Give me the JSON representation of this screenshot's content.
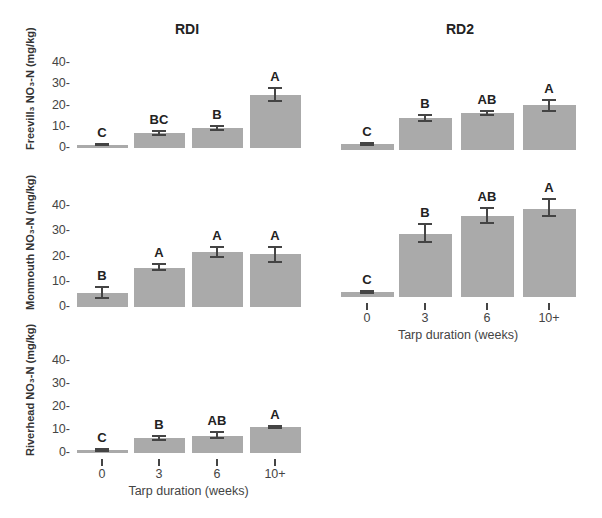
{
  "columns": [
    {
      "title": "RDI"
    },
    {
      "title": "RD2"
    }
  ],
  "rows": [
    {
      "ylabel": "Freevill₃ NO₃-N (mg/kg)"
    },
    {
      "ylabel": "Monmouth NO₃-N (mg/kg)"
    },
    {
      "ylabel": "Riverhead NO₃-N (mg/kg)"
    }
  ],
  "y_ticks": [
    "40-",
    "30-",
    "20-",
    "10-",
    "0-"
  ],
  "x_categories": [
    "0",
    "3",
    "6",
    "10+"
  ],
  "x_title": "Tarp duration (weeks)",
  "colors": {
    "bar": "#aaaaaa",
    "error": "#444444"
  },
  "chart_data": [
    {
      "type": "bar",
      "title": "RDI",
      "panel": "Freeville",
      "ylabel": "Freevill₃ NO₃-N (mg/kg)",
      "xlabel": "",
      "categories": [
        "0",
        "3",
        "6",
        "10+"
      ],
      "values": [
        1.5,
        7,
        9.5,
        25
      ],
      "error_low": [
        1.2,
        6,
        8.5,
        22
      ],
      "error_high": [
        2,
        7.8,
        10.3,
        28.5
      ],
      "letters": [
        "C",
        "BC",
        "B",
        "A"
      ],
      "ylim": [
        0,
        40
      ],
      "yticks": [
        0,
        10,
        20,
        30,
        40
      ]
    },
    {
      "type": "bar",
      "title": "RD2",
      "panel": "Freeville",
      "ylabel": "",
      "xlabel": "",
      "categories": [
        "0",
        "3",
        "6",
        "10+"
      ],
      "values": [
        3,
        15,
        17.5,
        21
      ],
      "error_low": [
        2.5,
        13.5,
        16.5,
        18.5
      ],
      "error_high": [
        3.5,
        16.5,
        18.5,
        23.5
      ],
      "letters": [
        "C",
        "B",
        "AB",
        "A"
      ],
      "ylim": [
        0,
        40
      ]
    },
    {
      "type": "bar",
      "title": "RDI",
      "panel": "Monmouth",
      "ylabel": "Monmouth NO₃-N (mg/kg)",
      "xlabel": "",
      "categories": [
        "0",
        "3",
        "6",
        "10+"
      ],
      "values": [
        5.5,
        15.5,
        22,
        21
      ],
      "error_low": [
        3.5,
        14.5,
        20,
        18
      ],
      "error_high": [
        8,
        17,
        24,
        24
      ],
      "letters": [
        "B",
        "A",
        "A",
        "A"
      ],
      "ylim": [
        0,
        40
      ],
      "yticks": [
        0,
        10,
        20,
        30,
        40
      ]
    },
    {
      "type": "bar",
      "title": "RD2",
      "panel": "Monmouth",
      "ylabel": "",
      "xlabel": "Tarp duration (weeks)",
      "categories": [
        "0",
        "3",
        "6",
        "10+"
      ],
      "values": [
        2,
        25,
        32,
        35
      ],
      "error_low": [
        1.5,
        22,
        29.5,
        32
      ],
      "error_high": [
        2.5,
        29,
        35.5,
        39
      ],
      "letters": [
        "C",
        "B",
        "AB",
        "A"
      ],
      "ylim": [
        0,
        40
      ]
    },
    {
      "type": "bar",
      "title": "",
      "panel": "Riverhead",
      "ylabel": "Riverhead NO₃-N (mg/kg)",
      "xlabel": "Tarp duration (weeks)",
      "categories": [
        "0",
        "3",
        "6",
        "10+"
      ],
      "values": [
        1.3,
        6.5,
        7.5,
        11.3
      ],
      "error_low": [
        1,
        5.8,
        6.5,
        11
      ],
      "error_high": [
        1.6,
        7.5,
        9,
        11.6
      ],
      "letters": [
        "C",
        "B",
        "AB",
        "A"
      ],
      "ylim": [
        0,
        40
      ],
      "yticks": [
        0,
        10,
        20,
        30,
        40
      ]
    }
  ]
}
